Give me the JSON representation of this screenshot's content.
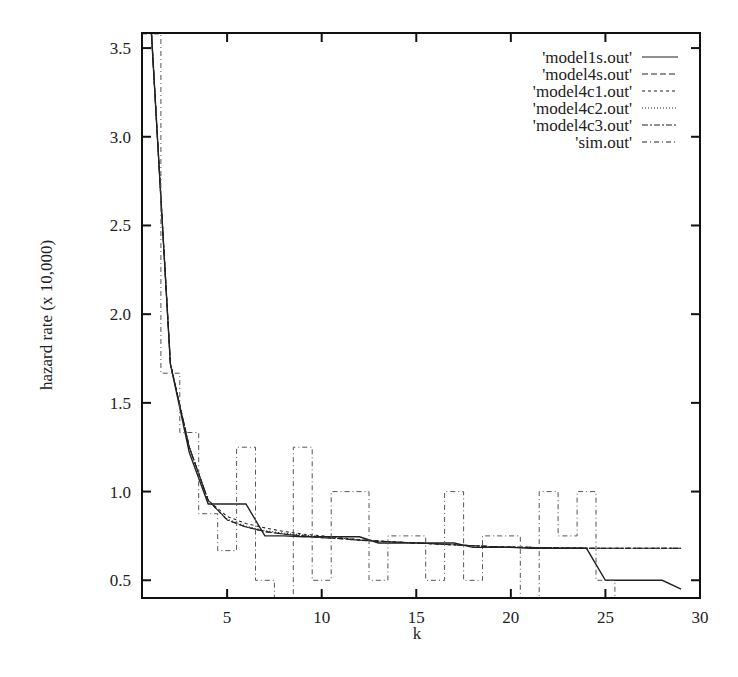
{
  "chart_data": {
    "type": "line",
    "title": "",
    "xlabel": "k",
    "ylabel": "hazard rate (x 10,000)",
    "xlim": [
      0.5,
      30
    ],
    "ylim": [
      0.4,
      3.585
    ],
    "xticks": [
      5,
      10,
      15,
      20,
      25,
      30
    ],
    "xtick_labels": [
      "5",
      "10",
      "15",
      "20",
      "25",
      "30"
    ],
    "yticks": [
      0.5,
      1.0,
      1.5,
      2.0,
      2.5,
      3.0,
      3.5
    ],
    "ytick_labels": [
      "0.5",
      "1.0",
      "1.5",
      "2.0",
      "2.5",
      "3.0",
      "3.5"
    ],
    "grid": false,
    "legend_position": "upper right, inside",
    "series": [
      {
        "name": "'model1s.out'",
        "style": "solid",
        "dash": "",
        "x": [
          1,
          2,
          3,
          4,
          5,
          6,
          7,
          8,
          9,
          10,
          11,
          12,
          13,
          14,
          15,
          16,
          17,
          18,
          19,
          20,
          21,
          22,
          23,
          24,
          25,
          26,
          27,
          28,
          29
        ],
        "values": [
          3.58,
          1.72,
          1.22,
          0.93,
          0.93,
          0.93,
          0.75,
          0.75,
          0.745,
          0.745,
          0.745,
          0.745,
          0.71,
          0.71,
          0.71,
          0.71,
          0.71,
          0.685,
          0.685,
          0.685,
          0.68,
          0.68,
          0.68,
          0.68,
          0.5,
          0.5,
          0.5,
          0.5,
          0.45
        ]
      },
      {
        "name": "'model4s.out'",
        "style": "dashed",
        "dash": "6,3",
        "x": [
          1,
          2,
          3,
          4,
          5,
          6,
          7,
          8,
          9,
          10,
          11,
          12,
          13,
          14,
          15,
          16,
          17,
          18,
          19,
          20,
          21,
          22,
          23,
          24,
          25,
          26,
          27,
          28,
          29
        ],
        "values": [
          3.58,
          1.72,
          1.25,
          0.95,
          0.84,
          0.8,
          0.775,
          0.76,
          0.75,
          0.74,
          0.735,
          0.725,
          0.72,
          0.715,
          0.71,
          0.705,
          0.7,
          0.695,
          0.69,
          0.687,
          0.685,
          0.683,
          0.682,
          0.681,
          0.68,
          0.68,
          0.68,
          0.68,
          0.68
        ]
      },
      {
        "name": "'model4c1.out'",
        "style": "short-dashed",
        "dash": "3,3",
        "x": [
          1,
          2,
          3,
          4,
          5,
          6,
          7,
          8,
          9,
          10,
          11,
          12,
          13,
          14,
          15,
          16,
          17,
          18,
          19,
          20,
          21,
          22,
          23,
          24,
          25,
          26,
          27,
          28,
          29
        ],
        "values": [
          3.58,
          1.72,
          1.25,
          0.95,
          0.86,
          0.82,
          0.795,
          0.775,
          0.76,
          0.75,
          0.74,
          0.73,
          0.722,
          0.715,
          0.71,
          0.705,
          0.7,
          0.695,
          0.69,
          0.687,
          0.685,
          0.683,
          0.682,
          0.681,
          0.68,
          0.68,
          0.68,
          0.68,
          0.68
        ]
      },
      {
        "name": "'model4c2.out'",
        "style": "dotted",
        "dash": "1,2",
        "x": [
          1,
          2,
          3,
          4,
          5,
          6,
          7,
          8,
          9,
          10,
          11,
          12,
          13,
          14,
          15,
          16,
          17,
          18,
          19,
          20,
          21,
          22,
          23,
          24,
          25,
          26,
          27,
          28,
          29
        ],
        "values": [
          3.58,
          1.72,
          1.25,
          0.95,
          0.845,
          0.805,
          0.78,
          0.765,
          0.755,
          0.745,
          0.737,
          0.728,
          0.72,
          0.715,
          0.71,
          0.705,
          0.7,
          0.695,
          0.69,
          0.687,
          0.685,
          0.683,
          0.682,
          0.681,
          0.68,
          0.68,
          0.68,
          0.68,
          0.68
        ]
      },
      {
        "name": "'model4c3.out'",
        "style": "dash-dot",
        "dash": "6,2,2,2",
        "x": [
          1,
          2,
          3,
          4,
          5,
          6,
          7,
          8,
          9,
          10,
          11,
          12,
          13,
          14,
          15,
          16,
          17,
          18,
          19,
          20,
          21,
          22,
          23,
          24,
          25,
          26,
          27,
          28,
          29
        ],
        "values": [
          3.58,
          1.72,
          1.25,
          0.95,
          0.84,
          0.8,
          0.775,
          0.76,
          0.75,
          0.74,
          0.735,
          0.725,
          0.72,
          0.715,
          0.71,
          0.705,
          0.7,
          0.695,
          0.69,
          0.687,
          0.685,
          0.683,
          0.682,
          0.681,
          0.68,
          0.68,
          0.68,
          0.68,
          0.68
        ]
      },
      {
        "name": "'sim.out'",
        "style": "dash-dot-step",
        "dash": "5,3,1,3",
        "step": "mid",
        "x": [
          1,
          2,
          3,
          4,
          5,
          6,
          7,
          8,
          9,
          10,
          11,
          12,
          13,
          14,
          15,
          16,
          17,
          18,
          19,
          20,
          21,
          22,
          23,
          24,
          25,
          26
        ],
        "values": [
          3.58,
          1.667,
          1.333,
          0.875,
          0.667,
          1.25,
          0.5,
          0.0,
          1.25,
          0.5,
          1.0,
          1.0,
          0.5,
          0.75,
          0.75,
          0.5,
          1.0,
          0.5,
          0.75,
          0.75,
          0.0,
          1.0,
          0.75,
          1.0,
          0.5,
          0.0
        ]
      }
    ]
  },
  "colors": {
    "line": "#222222",
    "axis": "#111111",
    "background": "#ffffff"
  }
}
